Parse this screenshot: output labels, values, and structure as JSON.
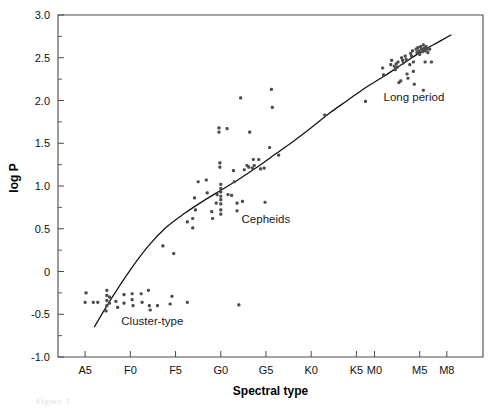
{
  "figure": {
    "caption_ghost": "Figure 1"
  },
  "axes": {
    "x_title": "Spectral type",
    "y_title": "log P",
    "x_ticks": [
      {
        "label": "A5",
        "pos": 0
      },
      {
        "label": "F0",
        "pos": 5
      },
      {
        "label": "F5",
        "pos": 10
      },
      {
        "label": "G0",
        "pos": 15
      },
      {
        "label": "G5",
        "pos": 20
      },
      {
        "label": "K0",
        "pos": 25
      },
      {
        "label": "K5",
        "pos": 30
      },
      {
        "label": "M0",
        "pos": 32
      },
      {
        "label": "M5",
        "pos": 37
      },
      {
        "label": "M8",
        "pos": 40
      }
    ],
    "y_ticks": [
      {
        "label": "3.0",
        "value": 3.0
      },
      {
        "label": "2.5",
        "value": 2.5
      },
      {
        "label": "2.0",
        "value": 2.0
      },
      {
        "label": "1.5",
        "value": 1.5
      },
      {
        "label": "1.0",
        "value": 1.0
      },
      {
        "label": "0.5",
        "value": 0.5
      },
      {
        "label": "0",
        "value": 0.0
      },
      {
        "label": "-0.5",
        "value": -0.5
      },
      {
        "label": "-1.0",
        "value": -1.0
      }
    ],
    "y_minor_values": [
      2.75,
      2.25,
      1.75,
      1.25,
      0.75,
      0.25,
      -0.25,
      -0.75
    ],
    "xlim": [
      -3,
      44
    ],
    "ylim": [
      -1.0,
      3.0
    ]
  },
  "annotations": [
    {
      "text": "Cluster-type",
      "x": 4.0,
      "y": -0.62
    },
    {
      "text": "Cepheids",
      "x": 17.3,
      "y": 0.57
    },
    {
      "text": "Long period",
      "x": 33.0,
      "y": 1.99
    }
  ],
  "colors": {
    "point": "#4d4d4d",
    "line": "#111111",
    "frame": "#4a4a4a",
    "background": "#ffffff"
  },
  "chart_data": {
    "type": "scatter",
    "title": "",
    "xlabel": "Spectral type",
    "ylabel": "log P",
    "xlim": [
      -3,
      44
    ],
    "ylim": [
      -1.0,
      3.0
    ],
    "grid": false,
    "legend": "none",
    "x_tick_labels": [
      "A5",
      "F0",
      "F5",
      "G0",
      "G5",
      "K0",
      "K5",
      "M0",
      "M5",
      "M8"
    ],
    "x_tick_positions": [
      0,
      5,
      10,
      15,
      20,
      25,
      30,
      32,
      37,
      40
    ],
    "y_tick_labels": [
      "3.0",
      "2.5",
      "2.0",
      "1.5",
      "1.0",
      "0.5",
      "0",
      "-0.5",
      "-1.0"
    ],
    "y_tick_values": [
      3.0,
      2.5,
      2.0,
      1.5,
      1.0,
      0.5,
      0.0,
      -0.5,
      -1.0
    ],
    "note": "x values are spectral subtype index where A5=0, F0=5, F5=10, G0=15, G5=20, K0=25, K5=30, M0=32, M5=37, M8=40",
    "annotations": [
      {
        "text": "Cluster-type",
        "x": 4.0,
        "y": -0.62
      },
      {
        "text": "Cepheids",
        "x": 17.3,
        "y": 0.57
      },
      {
        "text": "Long period",
        "x": 33.0,
        "y": 1.99
      }
    ],
    "series": [
      {
        "name": "Cluster-type",
        "marker": "dot",
        "color": "#4d4d4d",
        "points": [
          [
            0.1,
            -0.25
          ],
          [
            0.0,
            -0.36
          ],
          [
            0.9,
            -0.36
          ],
          [
            1.4,
            -0.36
          ],
          [
            2.4,
            -0.22
          ],
          [
            2.4,
            -0.28
          ],
          [
            2.4,
            -0.34
          ],
          [
            2.4,
            -0.4
          ],
          [
            2.3,
            -0.46
          ],
          [
            2.7,
            -0.3
          ],
          [
            2.7,
            -0.37
          ],
          [
            3.4,
            -0.35
          ],
          [
            3.6,
            -0.42
          ],
          [
            4.3,
            -0.27
          ],
          [
            4.3,
            -0.37
          ],
          [
            5.2,
            -0.26
          ],
          [
            5.2,
            -0.33
          ],
          [
            5.3,
            -0.4
          ],
          [
            6.2,
            -0.26
          ],
          [
            6.3,
            -0.36
          ],
          [
            7.0,
            -0.22
          ],
          [
            7.1,
            -0.4
          ],
          [
            7.2,
            -0.45
          ],
          [
            8.0,
            -0.4
          ],
          [
            9.4,
            -0.38
          ],
          [
            9.6,
            -0.29
          ],
          [
            11.3,
            -0.36
          ],
          [
            17.0,
            -0.39
          ]
        ]
      },
      {
        "name": "Cepheids",
        "marker": "dot",
        "color": "#4d4d4d",
        "points": [
          [
            8.6,
            0.3
          ],
          [
            9.8,
            0.21
          ],
          [
            11.3,
            0.58
          ],
          [
            11.9,
            0.62
          ],
          [
            11.9,
            0.51
          ],
          [
            12.1,
            0.86
          ],
          [
            12.2,
            0.72
          ],
          [
            12.5,
            1.05
          ],
          [
            13.4,
            1.07
          ],
          [
            13.5,
            0.92
          ],
          [
            14.0,
            0.7
          ],
          [
            14.1,
            0.62
          ],
          [
            14.5,
            0.8
          ],
          [
            14.6,
            0.9
          ],
          [
            15.0,
            1.02
          ],
          [
            15.0,
            0.97
          ],
          [
            15.0,
            0.93
          ],
          [
            15.0,
            0.88
          ],
          [
            15.0,
            0.84
          ],
          [
            15.0,
            0.79
          ],
          [
            15.0,
            0.72
          ],
          [
            15.0,
            0.67
          ],
          [
            14.9,
            1.27
          ],
          [
            14.9,
            1.22
          ],
          [
            14.8,
            1.68
          ],
          [
            14.8,
            1.63
          ],
          [
            15.7,
            1.67
          ],
          [
            15.8,
            0.9
          ],
          [
            16.2,
            0.89
          ],
          [
            16.4,
            1.18
          ],
          [
            16.5,
            1.05
          ],
          [
            16.8,
            0.8
          ],
          [
            16.8,
            0.71
          ],
          [
            17.2,
            2.03
          ],
          [
            17.4,
            0.82
          ],
          [
            18.1,
            1.22
          ],
          [
            18.2,
            1.63
          ],
          [
            18.5,
            1.21
          ],
          [
            18.6,
            1.31
          ],
          [
            18.7,
            1.24
          ],
          [
            19.2,
            1.31
          ],
          [
            19.4,
            1.2
          ],
          [
            19.8,
            1.21
          ],
          [
            19.9,
            0.81
          ],
          [
            20.4,
            1.45
          ],
          [
            20.6,
            2.13
          ],
          [
            20.7,
            1.92
          ],
          [
            21.4,
            1.36
          ],
          [
            17.9,
            1.24
          ],
          [
            17.6,
            1.19
          ]
        ]
      },
      {
        "name": "Long period",
        "marker": "dot",
        "color": "#4d4d4d",
        "points": [
          [
            26.5,
            1.83
          ],
          [
            31.0,
            1.99
          ],
          [
            32.9,
            2.38
          ],
          [
            33.0,
            2.3
          ],
          [
            33.8,
            2.42
          ],
          [
            33.9,
            2.47
          ],
          [
            34.2,
            2.4
          ],
          [
            34.3,
            2.36
          ],
          [
            34.4,
            2.43
          ],
          [
            34.5,
            2.39
          ],
          [
            34.6,
            2.45
          ],
          [
            34.7,
            2.21
          ],
          [
            34.9,
            2.23
          ],
          [
            35.0,
            2.5
          ],
          [
            35.1,
            2.47
          ],
          [
            35.2,
            2.44
          ],
          [
            35.4,
            2.52
          ],
          [
            35.5,
            2.48
          ],
          [
            35.6,
            2.31
          ],
          [
            35.7,
            2.26
          ],
          [
            36.0,
            2.55
          ],
          [
            36.1,
            2.52
          ],
          [
            36.2,
            2.58
          ],
          [
            36.3,
            2.45
          ],
          [
            36.4,
            2.19
          ],
          [
            36.6,
            2.6
          ],
          [
            36.7,
            2.56
          ],
          [
            36.8,
            2.62
          ],
          [
            36.9,
            2.58
          ],
          [
            37.0,
            2.54
          ],
          [
            37.1,
            2.63
          ],
          [
            37.2,
            2.6
          ],
          [
            37.3,
            2.57
          ],
          [
            37.4,
            2.65
          ],
          [
            37.5,
            2.61
          ],
          [
            37.6,
            2.58
          ],
          [
            37.7,
            2.63
          ],
          [
            37.8,
            2.6
          ],
          [
            37.9,
            2.56
          ],
          [
            37.4,
            2.12
          ],
          [
            37.6,
            2.45
          ],
          [
            38.1,
            2.6
          ],
          [
            38.3,
            2.45
          ],
          [
            35.9,
            2.42
          ],
          [
            36.3,
            2.34
          ]
        ]
      }
    ],
    "fit_curve": {
      "name": "mean relation",
      "description": "smooth monotonic curve through all variable-star classes",
      "points": [
        [
          1.0,
          -0.65
        ],
        [
          3.0,
          -0.3
        ],
        [
          5.0,
          0.02
        ],
        [
          7.0,
          0.3
        ],
        [
          9.0,
          0.52
        ],
        [
          11.0,
          0.68
        ],
        [
          13.0,
          0.82
        ],
        [
          15.0,
          0.95
        ],
        [
          17.0,
          1.08
        ],
        [
          19.0,
          1.22
        ],
        [
          21.0,
          1.37
        ],
        [
          23.0,
          1.52
        ],
        [
          25.0,
          1.68
        ],
        [
          27.0,
          1.85
        ],
        [
          29.0,
          2.0
        ],
        [
          31.0,
          2.15
        ],
        [
          33.0,
          2.28
        ],
        [
          35.0,
          2.42
        ],
        [
          37.0,
          2.56
        ],
        [
          39.0,
          2.68
        ],
        [
          40.5,
          2.77
        ]
      ]
    }
  }
}
